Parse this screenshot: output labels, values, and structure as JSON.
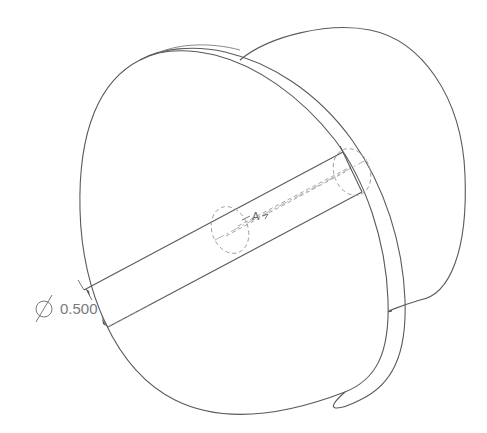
{
  "drawing": {
    "type": "isometric CAD part view",
    "part": "flanged disc with hub and through-hole shaft",
    "dimension": {
      "symbol": "⌀",
      "value": "0.500"
    },
    "feature_label": "A",
    "colors": {
      "background": "#ffffff",
      "lines": "#5a5a5a",
      "hidden_lines": "#9a9a9a",
      "text": "#7a7a7a"
    }
  }
}
